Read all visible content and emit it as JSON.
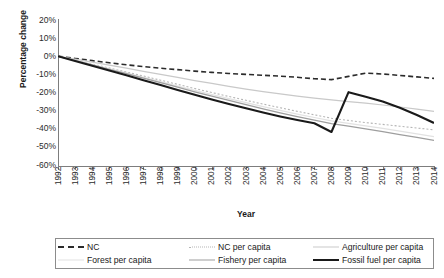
{
  "chart_data": {
    "type": "line",
    "title": "",
    "xlabel": "Year",
    "ylabel": "Percentage change",
    "grid": false,
    "legend_position": "bottom",
    "x": [
      1992,
      1993,
      1994,
      1995,
      1996,
      1997,
      1998,
      1999,
      2000,
      2001,
      2002,
      2003,
      2004,
      2005,
      2006,
      2007,
      2008,
      2009,
      2010,
      2011,
      2012,
      2013,
      2014
    ],
    "xlim": [
      1992,
      2014
    ],
    "ylim": [
      -60,
      20
    ],
    "ytick_values": [
      20,
      10,
      0,
      -10,
      -20,
      -30,
      -40,
      -50,
      -60
    ],
    "ytick_labels": [
      "20%",
      "10%",
      "0%",
      "-10%",
      "-20%",
      "-30%",
      "-40%",
      "-50%",
      "-60%"
    ],
    "xtick_labels": [
      "1992",
      "1993",
      "1994",
      "1995",
      "1996",
      "1997",
      "1998",
      "1999",
      "2000",
      "2001",
      "2002",
      "2003",
      "2004",
      "2005",
      "2006",
      "2007",
      "2008",
      "2009",
      "2010",
      "2011",
      "2012",
      "2013",
      "2014"
    ],
    "series": [
      {
        "name": "NC",
        "style": "dashed",
        "color": "#2b2b2b",
        "width": 1.6,
        "values": [
          0,
          -1.2,
          -2.4,
          -3.6,
          -4.7,
          -5.7,
          -6.6,
          -7.4,
          -8.2,
          -8.9,
          -9.5,
          -10.0,
          -10.5,
          -11.0,
          -11.6,
          -12.4,
          -12.9,
          -11.1,
          -9.3,
          -9.8,
          -10.6,
          -11.4,
          -12.2
        ]
      },
      {
        "name": "NC per capita",
        "style": "dotted",
        "color": "#b5b5b5",
        "width": 1.1,
        "values": [
          0,
          -2.2,
          -4.3,
          -6.5,
          -8.7,
          -10.9,
          -13.2,
          -15.5,
          -17.8,
          -20.0,
          -22.2,
          -24.3,
          -26.4,
          -28.4,
          -30.4,
          -32.3,
          -34.2,
          -35.4,
          -36.6,
          -37.6,
          -38.6,
          -39.6,
          -40.6
        ]
      },
      {
        "name": "Agriculture per capita",
        "style": "solid",
        "color": "#c9c9c9",
        "width": 1.2,
        "values": [
          0,
          -1.6,
          -3.2,
          -4.9,
          -6.6,
          -8.3,
          -10.0,
          -11.7,
          -13.4,
          -15.0,
          -16.6,
          -18.1,
          -19.5,
          -20.8,
          -22.0,
          -23.1,
          -24.1,
          -25.0,
          -25.9,
          -26.9,
          -28.0,
          -29.2,
          -30.4
        ]
      },
      {
        "name": "Forest per capita",
        "style": "solid",
        "color": "#e2e2e2",
        "width": 1.2,
        "values": [
          0,
          -2.3,
          -4.6,
          -6.9,
          -9.2,
          -11.6,
          -14.0,
          -16.4,
          -18.8,
          -21.1,
          -23.4,
          -25.6,
          -27.8,
          -29.9,
          -31.9,
          -33.8,
          -35.7,
          -37.0,
          -38.4,
          -39.8,
          -41.3,
          -42.8,
          -44.3
        ]
      },
      {
        "name": "Fishery per capita",
        "style": "solid",
        "color": "#9e9e9e",
        "width": 1.3,
        "values": [
          0,
          -2.4,
          -4.8,
          -7.2,
          -9.6,
          -12.1,
          -14.6,
          -17.1,
          -19.6,
          -22.0,
          -24.4,
          -26.7,
          -29.0,
          -31.2,
          -33.3,
          -35.3,
          -37.2,
          -38.6,
          -40.1,
          -41.6,
          -43.2,
          -44.8,
          -46.4
        ]
      },
      {
        "name": "Fossil fuel per capita",
        "style": "solid",
        "color": "#1a1a1a",
        "width": 2.1,
        "values": [
          0,
          -2.6,
          -5.2,
          -7.9,
          -10.5,
          -13.2,
          -15.9,
          -18.6,
          -21.2,
          -23.8,
          -26.3,
          -28.7,
          -31.0,
          -33.2,
          -35.2,
          -37.0,
          -41.8,
          -19.8,
          -22.4,
          -25.0,
          -28.4,
          -32.4,
          -36.8
        ]
      }
    ]
  },
  "legend": {
    "rows": [
      [
        {
          "label": "NC",
          "series": 0
        },
        {
          "label": "NC per capita",
          "series": 1
        },
        {
          "label": "Agriculture per capita",
          "series": 2
        }
      ],
      [
        {
          "label": "Forest per capita",
          "series": 3
        },
        {
          "label": "Fishery per capita",
          "series": 4
        },
        {
          "label": "Fossil fuel per capita",
          "series": 5
        }
      ]
    ]
  }
}
